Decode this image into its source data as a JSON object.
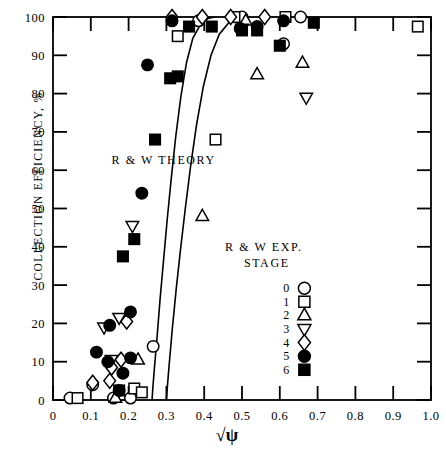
{
  "chart_data": {
    "type": "scatter",
    "title": "",
    "xlabel": "√ψ",
    "ylabel": "COLLECTION EFFICIENCY, %",
    "xlim": [
      0,
      1.0
    ],
    "ylim": [
      0,
      100
    ],
    "xticks": [
      0,
      0.1,
      0.2,
      0.3,
      0.4,
      0.5,
      0.6,
      0.7,
      0.8,
      0.9,
      1.0
    ],
    "xticklabels": [
      "0",
      "0.1",
      "0.2",
      "0.3",
      "0.4",
      "0.5",
      "0.6",
      "0.7",
      "0.8",
      "0.9",
      "1.0"
    ],
    "yticks": [
      0,
      10,
      20,
      30,
      40,
      50,
      60,
      70,
      80,
      90,
      100
    ],
    "yticklabels": [
      "0",
      "10",
      "20",
      "30",
      "40",
      "50",
      "60",
      "70",
      "80",
      "90",
      "100"
    ],
    "grid": false,
    "frame": "box",
    "annotations": [
      {
        "name": "theory-label",
        "text": "R & W THEORY",
        "x": 0.155,
        "y": 61.5
      },
      {
        "name": "exp-label-line1",
        "text": "R & W EXP.",
        "x": 0.455,
        "y": 39.0
      },
      {
        "name": "exp-label-line2",
        "text": "STAGE",
        "x": 0.505,
        "y": 34.6
      }
    ],
    "legend": {
      "title": "STAGE",
      "position": "inside-lower-right",
      "entries": [
        {
          "label": "0",
          "marker": "circle-open"
        },
        {
          "label": "1",
          "marker": "square-open"
        },
        {
          "label": "2",
          "marker": "triangle-up-open"
        },
        {
          "label": "3",
          "marker": "triangle-down-open"
        },
        {
          "label": "4",
          "marker": "diamond-open"
        },
        {
          "label": "5",
          "marker": "circle-filled"
        },
        {
          "label": "6",
          "marker": "square-filled"
        }
      ]
    },
    "curves": [
      {
        "name": "theory-curve-left",
        "points": [
          [
            0.262,
            0.0
          ],
          [
            0.264,
            3.0
          ],
          [
            0.268,
            8.0
          ],
          [
            0.275,
            16.0
          ],
          [
            0.283,
            26.0
          ],
          [
            0.292,
            36.0
          ],
          [
            0.302,
            47.0
          ],
          [
            0.313,
            58.0
          ],
          [
            0.325,
            69.0
          ],
          [
            0.338,
            79.0
          ],
          [
            0.353,
            88.0
          ],
          [
            0.37,
            94.5
          ],
          [
            0.39,
            98.0
          ],
          [
            0.41,
            99.6
          ],
          [
            0.428,
            100.0
          ]
        ]
      },
      {
        "name": "theory-curve-right",
        "points": [
          [
            0.3,
            0.0
          ],
          [
            0.303,
            4.0
          ],
          [
            0.308,
            10.0
          ],
          [
            0.316,
            19.0
          ],
          [
            0.326,
            29.0
          ],
          [
            0.337,
            39.0
          ],
          [
            0.35,
            50.0
          ],
          [
            0.364,
            61.0
          ],
          [
            0.38,
            72.0
          ],
          [
            0.398,
            82.0
          ],
          [
            0.418,
            90.0
          ],
          [
            0.44,
            95.5
          ],
          [
            0.465,
            98.5
          ],
          [
            0.49,
            99.8
          ],
          [
            0.512,
            100.0
          ]
        ]
      }
    ],
    "series": [
      {
        "name": "Stage 0",
        "marker": "circle-open",
        "points": [
          [
            0.045,
            0.5
          ],
          [
            0.105,
            4.0
          ],
          [
            0.16,
            0.5
          ],
          [
            0.205,
            0.5
          ],
          [
            0.265,
            14.0
          ],
          [
            0.385,
            99.0
          ],
          [
            0.5,
            100.0
          ],
          [
            0.61,
            93.0
          ],
          [
            0.655,
            100.0
          ]
        ]
      },
      {
        "name": "Stage 1",
        "marker": "square-open",
        "points": [
          [
            0.065,
            0.5
          ],
          [
            0.175,
            2.5
          ],
          [
            0.215,
            3.0
          ],
          [
            0.235,
            2.0
          ],
          [
            0.33,
            95.0
          ],
          [
            0.43,
            68.0
          ],
          [
            0.48,
            100.0
          ],
          [
            0.615,
            100.0
          ],
          [
            0.965,
            97.5
          ]
        ]
      },
      {
        "name": "Stage 2",
        "marker": "triangle-up-open",
        "points": [
          [
            0.165,
            0.5
          ],
          [
            0.225,
            10.5
          ],
          [
            0.395,
            48.0
          ],
          [
            0.51,
            99.0
          ],
          [
            0.54,
            85.0
          ],
          [
            0.66,
            88.0
          ]
        ]
      },
      {
        "name": "Stage 3",
        "marker": "triangle-down-open",
        "points": [
          [
            0.135,
            19.0
          ],
          [
            0.155,
            10.5
          ],
          [
            0.175,
            21.5
          ],
          [
            0.21,
            45.5
          ],
          [
            0.5,
            97.0
          ],
          [
            0.67,
            79.0
          ]
        ]
      },
      {
        "name": "Stage 4",
        "marker": "diamond-open",
        "points": [
          [
            0.105,
            4.5
          ],
          [
            0.15,
            5.0
          ],
          [
            0.155,
            8.5
          ],
          [
            0.18,
            10.5
          ],
          [
            0.195,
            20.5
          ],
          [
            0.315,
            100.0
          ],
          [
            0.395,
            100.0
          ],
          [
            0.47,
            100.0
          ],
          [
            0.56,
            100.0
          ]
        ]
      },
      {
        "name": "Stage 5",
        "marker": "circle-filled",
        "points": [
          [
            0.115,
            12.5
          ],
          [
            0.145,
            10.0
          ],
          [
            0.175,
            2.5
          ],
          [
            0.15,
            19.5
          ],
          [
            0.185,
            7.0
          ],
          [
            0.205,
            23.0
          ],
          [
            0.205,
            11.0
          ],
          [
            0.235,
            54.0
          ],
          [
            0.25,
            87.5
          ],
          [
            0.315,
            99.0
          ],
          [
            0.495,
            97.0
          ],
          [
            0.54,
            97.5
          ],
          [
            0.61,
            99.0
          ]
        ]
      },
      {
        "name": "Stage 6",
        "marker": "square-filled",
        "points": [
          [
            0.185,
            37.5
          ],
          [
            0.215,
            42.0
          ],
          [
            0.27,
            68.0
          ],
          [
            0.31,
            84.0
          ],
          [
            0.33,
            84.5
          ],
          [
            0.36,
            97.5
          ],
          [
            0.42,
            97.5
          ],
          [
            0.5,
            96.5
          ],
          [
            0.54,
            96.5
          ],
          [
            0.6,
            92.5
          ],
          [
            0.69,
            98.5
          ]
        ]
      }
    ]
  },
  "axis": {
    "y_title": "COLLECTION EFFICIENCY, %",
    "x_title": "√ψ"
  }
}
